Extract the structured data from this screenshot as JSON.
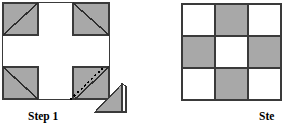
{
  "figure": {
    "background_color": "#ffffff",
    "shape_fill_gray": "#a8a8a8",
    "shape_fill_white": "#ffffff",
    "outline_color": "#3a3a3a",
    "fold_line_color": "#000000"
  },
  "panels": [
    {
      "id": "step1",
      "caption": "Step 1",
      "description": "Large white square with four gray corner squares forming a white cross; each gray corner square is crossed by a solid diagonal; the bottom-right corner square also shows a dotted fold line and a detached gray right triangle below-right.",
      "outer_square": {
        "x": 2,
        "y": 2,
        "width": 108,
        "height": 98
      },
      "corner_squares": [
        {
          "name": "top-left",
          "fill": "#a8a8a8",
          "diagonal": "bottom-left-to-top-right"
        },
        {
          "name": "top-right",
          "fill": "#a8a8a8",
          "diagonal": "top-left-to-bottom-right"
        },
        {
          "name": "bottom-left",
          "fill": "#a8a8a8",
          "diagonal": "top-left-to-bottom-right"
        },
        {
          "name": "bottom-right",
          "fill": "#a8a8a8",
          "diagonal": "bottom-left-to-top-right",
          "fold_line": "dotted"
        }
      ],
      "detached_triangle": {
        "name": "cut-corner-triangle",
        "fill": "#a8a8a8",
        "right_angle_corner": "bottom-right",
        "has_flap": true
      }
    },
    {
      "id": "step2",
      "caption": "Ste",
      "caption_full": "Step 2",
      "description": "Three by three checkerboard grid, white at corners and center, gray at edge midpoints. Right edge of the grid is cropped by the image boundary.",
      "grid": {
        "x": 182,
        "y": 4,
        "cell_size": 33,
        "rows": 3,
        "columns": 3,
        "cropped_right": true,
        "cells": [
          [
            "white",
            "gray",
            "white"
          ],
          [
            "gray",
            "white",
            "gray"
          ],
          [
            "white",
            "gray",
            "white"
          ]
        ]
      }
    }
  ]
}
